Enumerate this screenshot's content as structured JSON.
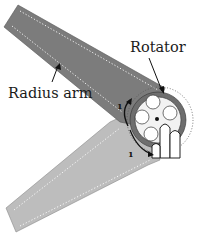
{
  "diagram": {
    "type": "mechanical-illustration",
    "labels": {
      "rotator": "Rotator",
      "radius_arm": "Radius arm"
    },
    "markers": {
      "top": "1",
      "bottom": "1"
    },
    "components": [
      {
        "id": "upper-arm",
        "description": "Radius arm (dark)",
        "color": "#7c7c7c"
      },
      {
        "id": "lower-arm",
        "description": "Lower arm (light)",
        "color": "#bdbdbd"
      },
      {
        "id": "rotator",
        "description": "Rotator disk with four holes and center pivot",
        "ring_color": "#6e6e6e",
        "disk_color": "#f2f2f2"
      },
      {
        "id": "fingers",
        "description": "Finger shapes gripping rotator",
        "color": "#ffffff"
      }
    ],
    "colors": {
      "upper_arm": "#7c7c7c",
      "lower_arm": "#bdbdbd",
      "rotator_ring": "#6e6e6e",
      "rotator_disk": "#f2f2f2",
      "outline": "#222222",
      "stitch": "#ffffff"
    }
  }
}
